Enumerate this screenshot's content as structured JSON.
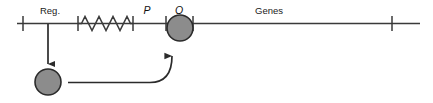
{
  "diagram": {
    "type": "operon-regulation-diagram",
    "background_color": "#ffffff",
    "line_color": "#3a3a3a",
    "circle_fill": "#8c8c8c",
    "circle_stroke": "#2b2b2b",
    "labels": {
      "regulator": "Reg.",
      "promoter": "P",
      "operator": "O",
      "genes": "Genes"
    },
    "elements": {
      "dna_line": "dna-backbone-line",
      "squiggle": "squiggle-spacer",
      "repressor_protein": "repressor-circle",
      "bound_repressor": "operator-bound-repressor-circle",
      "expression_arrow": "regulator-to-protein-arrow",
      "binding_arrow": "protein-to-operator-arrow"
    },
    "tick_positions": [
      23,
      78,
      133,
      166,
      193,
      392
    ]
  }
}
